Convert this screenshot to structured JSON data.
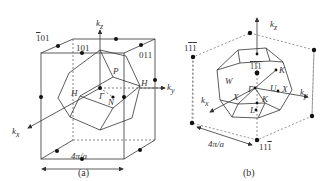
{
  "panel_a": {
    "caption": "(a)",
    "axes": {
      "kz": "k",
      "kz_sub": "z",
      "ky": "k",
      "ky_sub": "y",
      "kx": "k",
      "kx_sub": "x"
    },
    "points": [
      "101",
      "101",
      "011",
      "P",
      "H",
      "H",
      "Γ",
      "N"
    ],
    "label_101_bar_digit": "1",
    "label_101_bar_rest": "01",
    "label_101": "101",
    "label_011": "011",
    "label_P": "P",
    "label_H_left": "H",
    "label_H_right": "H",
    "label_Gamma": "Γ",
    "label_N": "N",
    "scale": "4π/a"
  },
  "panel_b": {
    "caption": "(b)",
    "axes": {
      "kz": "k",
      "kz_sub": "z",
      "ky": "k",
      "ky_sub": "y",
      "kx": "k",
      "kx_sub": "x"
    },
    "label_1_1_1_top_a": "1",
    "label_1_1_1_top_b": "1",
    "label_1_1_1_top_c": "1",
    "label_111_center_a": "1",
    "label_111_center_b": "1",
    "label_111_center_c": "1",
    "label_11_1_bottom_a": "1",
    "label_11_1_bottom_b": "1",
    "label_11_1_bottom_c": "1",
    "label_W": "W",
    "label_Gamma": "Γ",
    "label_K_top": "K",
    "label_U": "U",
    "label_X_right": "X",
    "label_X_left": "X",
    "label_K_mid": "K",
    "label_L": "L",
    "scale": "4π/a"
  },
  "colors": {
    "line": "#333333",
    "dash": "#666666",
    "dot": "#111111"
  }
}
